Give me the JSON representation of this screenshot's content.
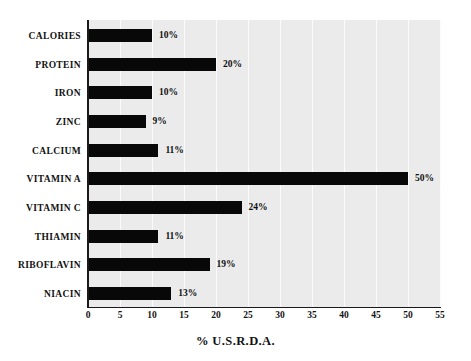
{
  "chart_data": {
    "type": "bar",
    "orientation": "horizontal",
    "title": "",
    "xlabel": "% U.S.R.D.A.",
    "ylabel": "",
    "xlim": [
      0,
      55
    ],
    "xticks": [
      0,
      5,
      10,
      15,
      20,
      25,
      30,
      35,
      40,
      45,
      50,
      55
    ],
    "xtick_labels": [
      "0",
      "5",
      "10",
      "15",
      "20",
      "25",
      "30",
      "35",
      "40",
      "45",
      "50",
      "55"
    ],
    "grid": "vertical",
    "legend": "none",
    "categories": [
      "CALORIES",
      "PROTEIN",
      "IRON",
      "ZINC",
      "CALCIUM",
      "VITAMIN A",
      "VITAMIN C",
      "THIAMIN",
      "RIBOFLAVIN",
      "NIACIN"
    ],
    "values": [
      10,
      20,
      10,
      9,
      11,
      50,
      24,
      11,
      19,
      13
    ],
    "data_labels": [
      "10%",
      "20%",
      "10%",
      "9%",
      "11%",
      "50%",
      "24%",
      "11%",
      "19%",
      "13%"
    ],
    "colors": {
      "bar": "#080808",
      "plot_background": "#ebebeb",
      "gridline": "#fbfbfb",
      "axis": "#1a1a1a",
      "text": "#111111",
      "page_background": "#ffffff"
    }
  }
}
